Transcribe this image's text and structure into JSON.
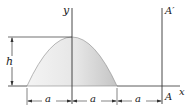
{
  "figure": {
    "labels": {
      "y_axis": "y",
      "x_axis": "x",
      "point_A": "A",
      "axis_A_prime": "A′",
      "height": "h",
      "dims": [
        "a",
        "a",
        "a"
      ]
    },
    "colors": {
      "line": "#333333",
      "fill_light": "#f2f2f2",
      "fill_dark": "#c8c8c8"
    }
  }
}
